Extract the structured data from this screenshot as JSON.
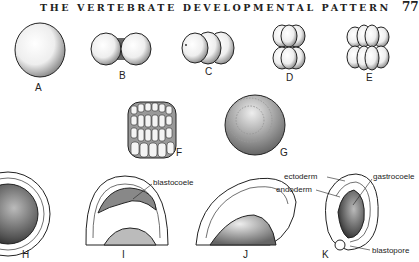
{
  "page": {
    "running_head": "THE VERTEBRATE DEVELOPMENTAL PATTERN",
    "page_number": "77"
  },
  "figure": {
    "panels": [
      {
        "id": "A",
        "label": "A"
      },
      {
        "id": "B",
        "label": "B"
      },
      {
        "id": "C",
        "label": "C"
      },
      {
        "id": "D",
        "label": "D"
      },
      {
        "id": "E",
        "label": "E"
      },
      {
        "id": "F",
        "label": "F"
      },
      {
        "id": "G",
        "label": "G"
      },
      {
        "id": "H",
        "label": "H"
      },
      {
        "id": "I",
        "label": "I"
      },
      {
        "id": "J",
        "label": "J"
      },
      {
        "id": "K",
        "label": "K"
      }
    ],
    "annotations": {
      "blastocoele": "blastocoele",
      "ectoderm": "ectoderm",
      "endoderm": "endoderm",
      "gastrocoele": "gastrocoele",
      "blastopore": "blastopore"
    }
  }
}
